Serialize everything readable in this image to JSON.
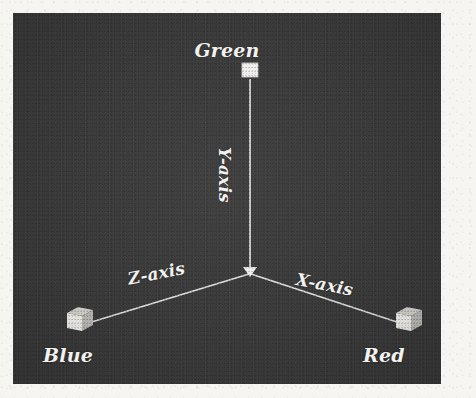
{
  "figure": {
    "background_color": "#3b3b3b",
    "line_color": "#e8e8e6",
    "label_color": "#f3f2ef",
    "margin_color": "#f6f5f2"
  },
  "axes": [
    {
      "id": "y-axis",
      "label": "Y-axis",
      "endpoint_label": "Green",
      "endpoint_marker": "cube-flat",
      "direction": "up",
      "label_rotation_deg": 90,
      "origin": [
        237,
        259
      ],
      "endpoint": [
        237,
        62
      ]
    },
    {
      "id": "x-axis",
      "label": "X-axis",
      "endpoint_label": "Red",
      "endpoint_marker": "cube-iso",
      "direction": "down-right",
      "label_rotation_deg": 11,
      "origin": [
        237,
        259
      ],
      "endpoint": [
        392,
        311
      ]
    },
    {
      "id": "z-axis",
      "label": "Z-axis",
      "endpoint_label": "Blue",
      "endpoint_marker": "cube-iso",
      "direction": "down-left",
      "label_rotation_deg": -11,
      "origin": [
        237,
        259
      ],
      "endpoint": [
        67,
        311
      ]
    }
  ],
  "labels": {
    "green": "Green",
    "blue": "Blue",
    "red": "Red",
    "y_axis": "Y-axis",
    "x_axis": "X-axis",
    "z_axis": "Z-axis"
  },
  "markers": {
    "green_cube": "green-cube-marker",
    "blue_cube": "blue-cube-marker",
    "red_cube": "red-cube-marker",
    "origin_arrow": "origin-arrowhead"
  }
}
